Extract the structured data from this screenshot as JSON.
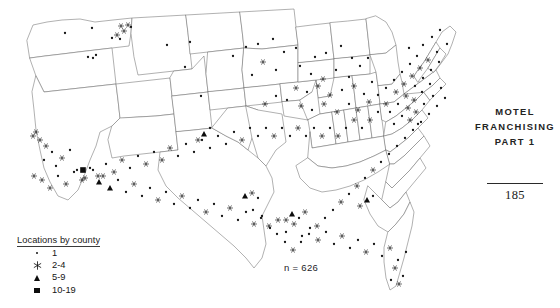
{
  "figure": {
    "sample_size_label": "n = 626",
    "map_name": "united-states-county-dot-map"
  },
  "legend": {
    "title": "Locations by county",
    "items": [
      {
        "symbol": "dot",
        "label": "1"
      },
      {
        "symbol": "asterisk",
        "label": "2-4"
      },
      {
        "symbol": "triangle",
        "label": "5-9"
      },
      {
        "symbol": "square",
        "label": "10-19"
      }
    ]
  },
  "page": {
    "running_head_line1": "MOTEL",
    "running_head_line2": "FRANCHISING",
    "running_head_line3": "PART 1",
    "folio": "185"
  },
  "colors": {
    "ink": "#151515",
    "state_outline": "#6f6f6f",
    "nation_outline": "#4a4a4a",
    "background": "#ffffff"
  },
  "chart_data": {
    "type": "scatter",
    "subtitle": "n = 626",
    "xlabel": "",
    "ylabel": "",
    "grid": false,
    "legend_position": "bottom-left",
    "projection": "albers-usa-schematic",
    "classes": [
      {
        "symbol": "dot",
        "range": "1",
        "min": 1,
        "max": 1
      },
      {
        "symbol": "asterisk",
        "range": "2-4",
        "min": 2,
        "max": 4
      },
      {
        "symbol": "triangle",
        "range": "5-9",
        "min": 5,
        "max": 9
      },
      {
        "symbol": "square",
        "range": "10-19",
        "min": 10,
        "max": 19
      }
    ],
    "total_locations": 626,
    "points": [
      [
        65,
        33,
        "dot"
      ],
      [
        92,
        28,
        "dot"
      ],
      [
        121,
        26,
        "star"
      ],
      [
        128,
        25,
        "star"
      ],
      [
        124,
        31,
        "star"
      ],
      [
        117,
        35,
        "star"
      ],
      [
        120,
        39,
        "dot"
      ],
      [
        131,
        27,
        "dot"
      ],
      [
        112,
        38,
        "dot"
      ],
      [
        88,
        57,
        "dot"
      ],
      [
        93,
        58,
        "dot"
      ],
      [
        96,
        55,
        "dot"
      ],
      [
        167,
        45,
        "dot"
      ],
      [
        190,
        42,
        "dot"
      ],
      [
        185,
        67,
        "dot"
      ],
      [
        201,
        96,
        "dot"
      ],
      [
        233,
        56,
        "dot"
      ],
      [
        246,
        47,
        "dot"
      ],
      [
        258,
        44,
        "dot"
      ],
      [
        273,
        39,
        "dot"
      ],
      [
        284,
        52,
        "dot"
      ],
      [
        296,
        48,
        "dot"
      ],
      [
        263,
        62,
        "star"
      ],
      [
        276,
        70,
        "dot"
      ],
      [
        252,
        75,
        "dot"
      ],
      [
        300,
        66,
        "dot"
      ],
      [
        315,
        57,
        "dot"
      ],
      [
        326,
        53,
        "dot"
      ],
      [
        341,
        46,
        "dot"
      ],
      [
        352,
        58,
        "dot"
      ],
      [
        311,
        74,
        "dot"
      ],
      [
        323,
        79,
        "star"
      ],
      [
        336,
        70,
        "dot"
      ],
      [
        349,
        77,
        "dot"
      ],
      [
        360,
        66,
        "dot"
      ],
      [
        368,
        58,
        "dot"
      ],
      [
        296,
        88,
        "star"
      ],
      [
        307,
        92,
        "dot"
      ],
      [
        318,
        86,
        "star"
      ],
      [
        330,
        95,
        "star"
      ],
      [
        342,
        90,
        "dot"
      ],
      [
        354,
        86,
        "star"
      ],
      [
        364,
        94,
        "dot"
      ],
      [
        372,
        82,
        "dot"
      ],
      [
        287,
        100,
        "dot"
      ],
      [
        276,
        96,
        "dot"
      ],
      [
        265,
        104,
        "star"
      ],
      [
        301,
        106,
        "star"
      ],
      [
        312,
        110,
        "dot"
      ],
      [
        324,
        104,
        "star"
      ],
      [
        337,
        112,
        "star"
      ],
      [
        349,
        104,
        "dot"
      ],
      [
        358,
        110,
        "star"
      ],
      [
        369,
        102,
        "star"
      ],
      [
        378,
        95,
        "dot"
      ],
      [
        386,
        88,
        "dot"
      ],
      [
        394,
        80,
        "dot"
      ],
      [
        402,
        72,
        "dot"
      ],
      [
        410,
        64,
        "dot"
      ],
      [
        417,
        56,
        "dot"
      ],
      [
        409,
        48,
        "dot"
      ],
      [
        423,
        45,
        "dot"
      ],
      [
        432,
        37,
        "dot"
      ],
      [
        440,
        30,
        "dot"
      ],
      [
        447,
        44,
        "dot"
      ],
      [
        437,
        52,
        "dot"
      ],
      [
        428,
        60,
        "star"
      ],
      [
        420,
        68,
        "star"
      ],
      [
        412,
        76,
        "star"
      ],
      [
        404,
        84,
        "star"
      ],
      [
        396,
        92,
        "star"
      ],
      [
        415,
        86,
        "dot"
      ],
      [
        423,
        78,
        "dot"
      ],
      [
        431,
        70,
        "dot"
      ],
      [
        439,
        62,
        "dot"
      ],
      [
        406,
        96,
        "star"
      ],
      [
        414,
        100,
        "star"
      ],
      [
        422,
        92,
        "dot"
      ],
      [
        430,
        84,
        "dot"
      ],
      [
        398,
        104,
        "dot"
      ],
      [
        390,
        112,
        "dot"
      ],
      [
        408,
        108,
        "star"
      ],
      [
        416,
        112,
        "star"
      ],
      [
        424,
        104,
        "dot"
      ],
      [
        433,
        96,
        "dot"
      ],
      [
        441,
        88,
        "dot"
      ],
      [
        402,
        116,
        "dot"
      ],
      [
        394,
        124,
        "dot"
      ],
      [
        410,
        120,
        "star"
      ],
      [
        418,
        124,
        "dot"
      ],
      [
        386,
        104,
        "star"
      ],
      [
        378,
        112,
        "dot"
      ],
      [
        370,
        120,
        "star"
      ],
      [
        362,
        128,
        "dot"
      ],
      [
        354,
        120,
        "star"
      ],
      [
        346,
        128,
        "dot"
      ],
      [
        338,
        136,
        "star"
      ],
      [
        330,
        128,
        "dot"
      ],
      [
        322,
        136,
        "star"
      ],
      [
        314,
        128,
        "dot"
      ],
      [
        306,
        136,
        "dot"
      ],
      [
        298,
        128,
        "star"
      ],
      [
        290,
        136,
        "dot"
      ],
      [
        282,
        128,
        "dot"
      ],
      [
        274,
        136,
        "star"
      ],
      [
        266,
        128,
        "dot"
      ],
      [
        258,
        136,
        "dot"
      ],
      [
        250,
        128,
        "dot"
      ],
      [
        242,
        140,
        "star"
      ],
      [
        234,
        132,
        "dot"
      ],
      [
        226,
        144,
        "dot"
      ],
      [
        218,
        136,
        "dot"
      ],
      [
        210,
        148,
        "dot"
      ],
      [
        202,
        140,
        "dot"
      ],
      [
        194,
        152,
        "dot"
      ],
      [
        186,
        144,
        "dot"
      ],
      [
        178,
        156,
        "dot"
      ],
      [
        170,
        148,
        "star"
      ],
      [
        162,
        160,
        "star"
      ],
      [
        154,
        152,
        "dot"
      ],
      [
        146,
        164,
        "star"
      ],
      [
        138,
        156,
        "dot"
      ],
      [
        130,
        168,
        "dot"
      ],
      [
        122,
        160,
        "star"
      ],
      [
        114,
        172,
        "star"
      ],
      [
        106,
        164,
        "dot"
      ],
      [
        98,
        176,
        "star"
      ],
      [
        90,
        168,
        "dot"
      ],
      [
        82,
        180,
        "star"
      ],
      [
        74,
        172,
        "dot"
      ],
      [
        66,
        184,
        "star"
      ],
      [
        58,
        176,
        "dot"
      ],
      [
        50,
        188,
        "star"
      ],
      [
        42,
        180,
        "star"
      ],
      [
        34,
        176,
        "star"
      ],
      [
        40,
        140,
        "star"
      ],
      [
        36,
        132,
        "star"
      ],
      [
        33,
        136,
        "star"
      ],
      [
        46,
        146,
        "star"
      ],
      [
        52,
        152,
        "dot"
      ],
      [
        44,
        160,
        "dot"
      ],
      [
        56,
        166,
        "dot"
      ],
      [
        62,
        158,
        "star"
      ],
      [
        70,
        150,
        "dot"
      ],
      [
        77,
        170,
        "dot"
      ],
      [
        85,
        178,
        "star"
      ],
      [
        93,
        170,
        "dot"
      ],
      [
        99,
        182,
        "tri"
      ],
      [
        83,
        170,
        "sq"
      ],
      [
        103,
        176,
        "star"
      ],
      [
        110,
        188,
        "tri"
      ],
      [
        118,
        180,
        "dot"
      ],
      [
        126,
        192,
        "dot"
      ],
      [
        134,
        184,
        "star"
      ],
      [
        142,
        196,
        "dot"
      ],
      [
        150,
        188,
        "dot"
      ],
      [
        158,
        200,
        "star"
      ],
      [
        166,
        192,
        "dot"
      ],
      [
        174,
        204,
        "dot"
      ],
      [
        182,
        196,
        "star"
      ],
      [
        190,
        208,
        "dot"
      ],
      [
        198,
        200,
        "dot"
      ],
      [
        206,
        212,
        "star"
      ],
      [
        214,
        204,
        "dot"
      ],
      [
        222,
        216,
        "dot"
      ],
      [
        230,
        208,
        "star"
      ],
      [
        238,
        220,
        "dot"
      ],
      [
        246,
        212,
        "dot"
      ],
      [
        254,
        224,
        "star"
      ],
      [
        262,
        216,
        "dot"
      ],
      [
        270,
        228,
        "dot"
      ],
      [
        278,
        220,
        "star"
      ],
      [
        286,
        232,
        "dot"
      ],
      [
        294,
        224,
        "star"
      ],
      [
        302,
        236,
        "dot"
      ],
      [
        310,
        228,
        "dot"
      ],
      [
        318,
        240,
        "star"
      ],
      [
        326,
        232,
        "dot"
      ],
      [
        334,
        244,
        "dot"
      ],
      [
        342,
        236,
        "star"
      ],
      [
        350,
        248,
        "dot"
      ],
      [
        358,
        240,
        "dot"
      ],
      [
        366,
        252,
        "star"
      ],
      [
        374,
        244,
        "dot"
      ],
      [
        382,
        256,
        "dot"
      ],
      [
        390,
        248,
        "star"
      ],
      [
        398,
        260,
        "dot"
      ],
      [
        406,
        252,
        "dot"
      ],
      [
        395,
        268,
        "star"
      ],
      [
        403,
        276,
        "dot"
      ],
      [
        399,
        284,
        "star"
      ],
      [
        391,
        280,
        "dot"
      ],
      [
        245,
        196,
        "tri"
      ],
      [
        252,
        193,
        "star"
      ],
      [
        258,
        198,
        "dot"
      ],
      [
        292,
        214,
        "tri"
      ],
      [
        299,
        218,
        "dot"
      ],
      [
        305,
        212,
        "star"
      ],
      [
        286,
        220,
        "star"
      ],
      [
        367,
        200,
        "tri"
      ],
      [
        373,
        196,
        "dot"
      ],
      [
        360,
        206,
        "star"
      ],
      [
        204,
        134,
        "tri"
      ],
      [
        198,
        140,
        "star"
      ],
      [
        210,
        128,
        "dot"
      ],
      [
        437,
        106,
        "dot"
      ],
      [
        445,
        98,
        "dot"
      ],
      [
        429,
        114,
        "dot"
      ],
      [
        421,
        122,
        "dot"
      ],
      [
        413,
        130,
        "dot"
      ],
      [
        405,
        138,
        "dot"
      ],
      [
        397,
        146,
        "dot"
      ],
      [
        389,
        154,
        "dot"
      ],
      [
        381,
        162,
        "dot"
      ],
      [
        373,
        170,
        "star"
      ],
      [
        365,
        178,
        "dot"
      ],
      [
        357,
        186,
        "star"
      ],
      [
        349,
        194,
        "dot"
      ],
      [
        341,
        202,
        "star"
      ],
      [
        333,
        210,
        "dot"
      ],
      [
        325,
        218,
        "dot"
      ],
      [
        317,
        226,
        "star"
      ],
      [
        309,
        234,
        "dot"
      ],
      [
        301,
        242,
        "dot"
      ],
      [
        293,
        250,
        "star"
      ],
      [
        285,
        242,
        "dot"
      ],
      [
        277,
        234,
        "dot"
      ],
      [
        269,
        226,
        "star"
      ],
      [
        261,
        218,
        "dot"
      ],
      [
        253,
        210,
        "dot"
      ]
    ]
  }
}
